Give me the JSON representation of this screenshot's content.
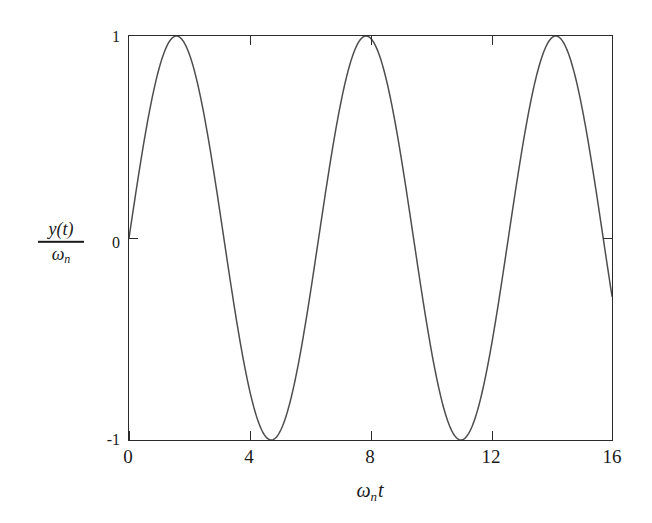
{
  "chart_data": {
    "type": "line",
    "title": "",
    "subtitle": "",
    "xlabel": "ωₙt",
    "ylabel": "y(t)/ωₙ",
    "equation": "y(t)/ωₙ = sin(ωₙt)",
    "xlim": [
      0,
      16
    ],
    "ylim": [
      -1,
      1
    ],
    "xticks": [
      0,
      4,
      8,
      12,
      16
    ],
    "yticks": [
      1,
      0,
      -1
    ],
    "xtick_labels": [
      "0",
      "4",
      "8",
      "12",
      "16"
    ],
    "ytick_labels": [
      "1",
      "0",
      "-1"
    ],
    "grid": false,
    "legend": false,
    "legend_position": "none",
    "line_color": "#4d4d4d",
    "frame_color": "#2b2b2b",
    "background_color": "#ffffff",
    "series": [
      {
        "name": "sin(ωₙt)",
        "color": "#4d4d4d",
        "peaks_x": [
          1.57,
          7.85,
          14.14
        ],
        "troughs_x": [
          4.71,
          11.0
        ],
        "zero_crossings_x": [
          0,
          3.14,
          6.28,
          9.42,
          12.57,
          15.71
        ],
        "x": [
          0,
          0.5,
          1,
          1.57,
          2,
          2.5,
          3,
          3.14,
          3.5,
          4,
          4.5,
          4.71,
          5,
          5.5,
          6,
          6.28,
          6.5,
          7,
          7.5,
          7.85,
          8,
          8.5,
          9,
          9.42,
          9.5,
          10,
          10.5,
          11,
          11.5,
          12,
          12.57,
          13,
          13.5,
          14.14,
          14.5,
          15,
          15.5,
          15.71,
          16
        ],
        "y": [
          0,
          0.479,
          0.841,
          1,
          0.909,
          0.599,
          0.141,
          0,
          -0.351,
          -0.757,
          -0.978,
          -1,
          -0.959,
          -0.706,
          -0.279,
          0,
          0.215,
          0.657,
          0.938,
          1,
          0.989,
          0.798,
          0.412,
          0,
          -0.075,
          -0.544,
          -0.88,
          -1,
          -0.938,
          -0.537,
          0,
          0.42,
          0.795,
          1,
          0.98,
          0.65,
          0.158,
          0,
          -0.288
        ]
      }
    ]
  },
  "axes": {
    "y_label_numerator": "y(t)",
    "y_label_denominator_symbol": "ω",
    "y_label_denominator_subscript": "n",
    "x_label_symbol": "ω",
    "x_label_subscript": "n",
    "x_label_variable": "t"
  },
  "xticks": [
    {
      "value": 0,
      "label": "0"
    },
    {
      "value": 4,
      "label": "4"
    },
    {
      "value": 8,
      "label": "8"
    },
    {
      "value": 12,
      "label": "12"
    },
    {
      "value": 16,
      "label": "16"
    }
  ],
  "yticks": [
    {
      "value": 1,
      "label": "1"
    },
    {
      "value": 0,
      "label": "0"
    },
    {
      "value": -1,
      "label": "-1"
    }
  ]
}
